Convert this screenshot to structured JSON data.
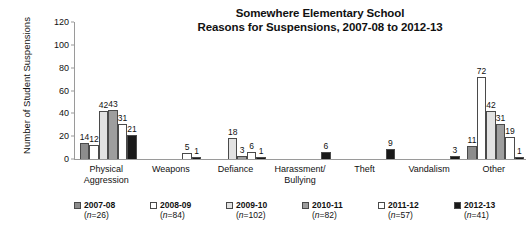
{
  "chart_data": {
    "type": "bar",
    "title": "Somewhere Elementary School\nReasons for Suspensions, 2007-08 to 2012-13",
    "title_line1": "Somewhere Elementary School",
    "title_line2": "Reasons for Suspensions, 2007-08 to 2012-13",
    "xlabel": "",
    "ylabel": "Number of Student Suspensions",
    "ylim": [
      0,
      120
    ],
    "yticks": [
      0,
      20,
      40,
      60,
      80,
      100,
      120
    ],
    "grid": false,
    "legend_position": "bottom",
    "categories": [
      "Physical Aggression",
      "Weapons",
      "Defiance",
      "Harassment/ Bullying",
      "Theft",
      "Vandalism",
      "Other"
    ],
    "category_lines": [
      [
        "Physical",
        "Aggression"
      ],
      [
        "Weapons"
      ],
      [
        "Defiance"
      ],
      [
        "Harassment/",
        "Bullying"
      ],
      [
        "Theft"
      ],
      [
        "Vandalism"
      ],
      [
        "Other"
      ]
    ],
    "series": [
      {
        "name": "2007-08",
        "n_label": "(n=26)",
        "n": 26,
        "color": "#8c8c8c",
        "values": [
          14,
          0,
          0,
          0,
          0,
          0,
          11
        ]
      },
      {
        "name": "2008-09",
        "n_label": "(n=84)",
        "n": 84,
        "color": "#ffffff",
        "values": [
          12,
          0,
          0,
          0,
          0,
          0,
          72
        ]
      },
      {
        "name": "2009-10",
        "n_label": "(n=102)",
        "n": 102,
        "color": "#e2e2e2",
        "values": [
          42,
          0,
          18,
          0,
          0,
          0,
          42
        ]
      },
      {
        "name": "2010-11",
        "n_label": "(n=82)",
        "n": 82,
        "color": "#9e9e9e",
        "values": [
          43,
          0,
          3,
          0,
          0,
          0,
          31
        ]
      },
      {
        "name": "2011-12",
        "n_label": "(n=57)",
        "n": 57,
        "color": "#ffffff",
        "values": [
          31,
          5,
          6,
          0,
          0,
          0,
          19
        ]
      },
      {
        "name": "2012-13",
        "n_label": "(n=41)",
        "n": 41,
        "color": "#1a1a1a",
        "values": [
          21,
          1,
          1,
          6,
          9,
          3,
          1
        ]
      }
    ]
  },
  "colors": {
    "axis": "#9a9a9a",
    "bar_outline": "#4a4a4a",
    "text": "#111111",
    "background": "#ffffff"
  }
}
